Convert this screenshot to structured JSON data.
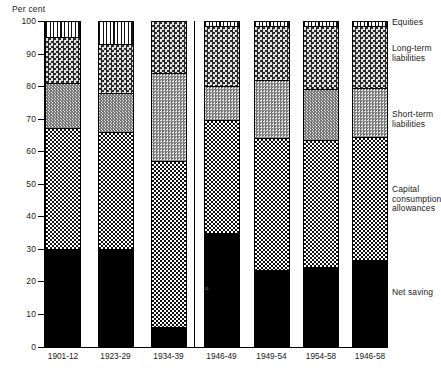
{
  "chart_data": {
    "type": "bar",
    "stacked": true,
    "title": "",
    "xlabel": "",
    "ylabel": "Per cent",
    "ylim": [
      0,
      100
    ],
    "yticks": [
      0,
      10,
      20,
      30,
      40,
      50,
      60,
      70,
      80,
      90,
      100
    ],
    "ytick_labels": [
      "0",
      "10",
      "20",
      "30",
      "40",
      "50",
      "60",
      "70",
      "80",
      "90",
      "100"
    ],
    "grid": false,
    "legend_position": "right",
    "categories": [
      "1901-12",
      "1923-29",
      "1934-39",
      "1946-49",
      "1949-54",
      "1954-58",
      "1946-58"
    ],
    "group_separator_after": "1934-39",
    "series": [
      {
        "name": "Net saving",
        "values": [
          30,
          30,
          6,
          35,
          23.5,
          24.5,
          26.5
        ]
      },
      {
        "name": "Capital consumption allowances",
        "values": [
          37,
          36,
          51,
          34.5,
          40.5,
          39,
          38
        ]
      },
      {
        "name": "Short-term liabilities",
        "values": [
          14,
          12,
          27,
          10.5,
          18,
          15.5,
          15
        ]
      },
      {
        "name": "Long-term liabilities",
        "values": [
          14,
          15,
          16,
          18.5,
          16.5,
          19.5,
          19
        ]
      },
      {
        "name": "Equities",
        "values": [
          5,
          7,
          0,
          1.5,
          1.5,
          1.5,
          1.5
        ]
      }
    ],
    "legend_entries": [
      "Equities",
      "Long-term\nliabilities",
      "Short-term\nliabilities",
      "Capital\nconsumption\nallowances",
      "Net saving"
    ]
  },
  "axis": {
    "unit_label": "Per cent"
  },
  "colors": {
    "net_saving": "#000000",
    "capital_consumption_allowances": "#fdfdfd",
    "short_term_liabilities": "#cfcfcf",
    "long_term_liabilities": "#b9b9b9",
    "equities": "#ffffff",
    "axis": "#000000"
  },
  "artifact": {
    "stray_mark": "o"
  }
}
